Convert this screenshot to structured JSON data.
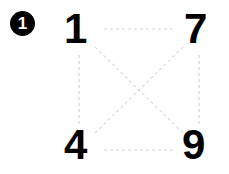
{
  "figure": {
    "badge": {
      "label": "1",
      "shape": "filled-circle",
      "fill_color": "#000000",
      "text_color": "#ffffff"
    },
    "nodes": [
      {
        "id": "top-left",
        "label": "1",
        "x": 80,
        "y": 29
      },
      {
        "id": "top-right",
        "label": "7",
        "x": 199,
        "y": 29
      },
      {
        "id": "bottom-left",
        "label": "4",
        "x": 80,
        "y": 150
      },
      {
        "id": "bottom-right",
        "label": "9",
        "x": 199,
        "y": 150
      }
    ],
    "edges": [
      {
        "id": "edge-top",
        "from": "top-left",
        "to": "top-right",
        "style": "dashed",
        "color": "#d2d2d2"
      },
      {
        "id": "edge-bottom",
        "from": "bottom-left",
        "to": "bottom-right",
        "style": "dashed",
        "color": "#d2d2d2"
      },
      {
        "id": "edge-left",
        "from": "top-left",
        "to": "bottom-left",
        "style": "dashed",
        "color": "#d2d2d2"
      },
      {
        "id": "edge-right",
        "from": "top-right",
        "to": "bottom-right",
        "style": "dashed",
        "color": "#d2d2d2"
      },
      {
        "id": "edge-diagonal-down",
        "from": "top-left",
        "to": "bottom-right",
        "style": "dashed",
        "color": "#dcdcdc"
      },
      {
        "id": "edge-diagonal-up",
        "from": "top-right",
        "to": "bottom-left",
        "style": "dashed",
        "color": "#dcdcdc"
      }
    ],
    "background_color": "#ffffff",
    "digit_color": "#000000"
  }
}
